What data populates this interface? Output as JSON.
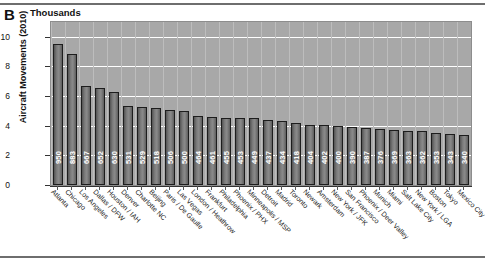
{
  "figure": {
    "panel_letter": "B",
    "units_title": "Thousands",
    "y_axis_label": "Aircraft Movements (2010)"
  },
  "chart_data": {
    "type": "bar",
    "title": "Thousands",
    "xlabel": "",
    "ylabel": "Aircraft Movements (2010)",
    "ylim": [
      0,
      11
    ],
    "yticks": [
      0,
      2,
      4,
      6,
      8,
      10
    ],
    "grid": true,
    "legend": "none",
    "value_units": "hundreds of thousands of movements",
    "categories": [
      "Atlanta",
      "Chicago",
      "Los Angeles",
      "Dallas / DFW",
      "Houston / IAH",
      "Denver",
      "Charlotte NC",
      "Beijing",
      "Paris / De Gaulle",
      "Las Vegas",
      "London / Heathrow",
      "Frankfurt",
      "Philadelphia",
      "Phoenix / PHX",
      "Minneapolis / MSP",
      "Detroit",
      "Madrid",
      "Toronto",
      "Newark",
      "Amsterdam",
      "New York / JFK",
      "San Francisco",
      "Phoenix / Deer Valley",
      "Munich",
      "Miami",
      "Salt Lake City",
      "New York / LGA",
      "Boston",
      "Tokyo",
      "Mexico City"
    ],
    "values": [
      950,
      883,
      667,
      652,
      630,
      531,
      529,
      518,
      506,
      500,
      464,
      461,
      455,
      453,
      449,
      437,
      434,
      418,
      404,
      402,
      400,
      390,
      387,
      376,
      369,
      363,
      362,
      353,
      343,
      340
    ],
    "data_labels": [
      "950",
      "883",
      "667",
      "652",
      "630",
      "531",
      "529",
      "518",
      "506",
      "500",
      "464",
      "461",
      "455",
      "453",
      "449",
      "437",
      "434",
      "418",
      "404",
      "402",
      "400",
      "390",
      "387",
      "376",
      "369",
      "363",
      "362",
      "353",
      "343",
      "340"
    ],
    "colors": {
      "plot_background": "#a8a8a8",
      "bar_fill": "#6b6b6b",
      "bar_edge": "#1d1d1d",
      "gridline": "#ffffff",
      "data_label": "#ffffff"
    }
  }
}
